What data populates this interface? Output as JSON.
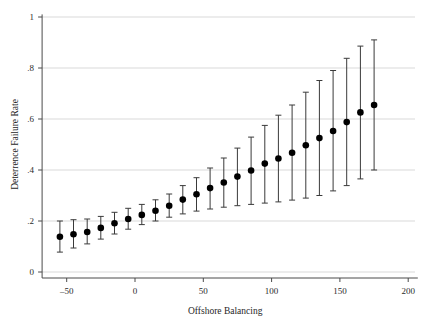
{
  "chart_data": {
    "type": "scatter",
    "title": "",
    "subtitle": "",
    "xlabel": "Offshore Balancing",
    "ylabel": "Deterrence Failure Rate",
    "xlim": [
      -68,
      207
    ],
    "ylim": [
      0,
      1
    ],
    "xticks": [
      -50,
      0,
      50,
      100,
      150,
      200
    ],
    "xtick_labels": [
      "–50",
      "0",
      "50",
      "100",
      "150",
      "200"
    ],
    "yticks": [
      0,
      0.2,
      0.4,
      0.6,
      0.8,
      1
    ],
    "ytick_labels": [
      "0",
      ".2",
      ".4",
      ".6",
      ".8",
      "1"
    ],
    "grid": "horizontal",
    "legend": "none",
    "marker": "filled-circle",
    "marker_color": "#000000",
    "errorbar_color": "#3a3a3a",
    "errorbar_style": "capped-vertical",
    "series": [
      {
        "name": "Predicted deterrence failure rate",
        "x": [
          -55,
          -45,
          -35,
          -25,
          -15,
          -5,
          5,
          15,
          25,
          35,
          45,
          55,
          65,
          75,
          85,
          95,
          105,
          115,
          125,
          135,
          145,
          155,
          165,
          175
        ],
        "values": [
          0.138,
          0.148,
          0.157,
          0.173,
          0.191,
          0.208,
          0.224,
          0.24,
          0.26,
          0.284,
          0.305,
          0.329,
          0.351,
          0.374,
          0.398,
          0.425,
          0.445,
          0.468,
          0.497,
          0.525,
          0.553,
          0.588,
          0.626,
          0.655
        ],
        "ci_low": [
          0.078,
          0.094,
          0.11,
          0.129,
          0.149,
          0.168,
          0.186,
          0.2,
          0.215,
          0.228,
          0.239,
          0.247,
          0.254,
          0.26,
          0.265,
          0.27,
          0.275,
          0.282,
          0.29,
          0.3,
          0.318,
          0.339,
          0.365,
          0.4
        ],
        "ci_high": [
          0.2,
          0.205,
          0.208,
          0.218,
          0.234,
          0.25,
          0.265,
          0.283,
          0.306,
          0.339,
          0.37,
          0.408,
          0.447,
          0.486,
          0.529,
          0.575,
          0.615,
          0.655,
          0.705,
          0.751,
          0.79,
          0.838,
          0.886,
          0.91
        ]
      }
    ]
  },
  "figure": {
    "background_color": "#ffffff",
    "grid_color": "#d9d9d9",
    "axis_color": "#4a4a4a"
  }
}
